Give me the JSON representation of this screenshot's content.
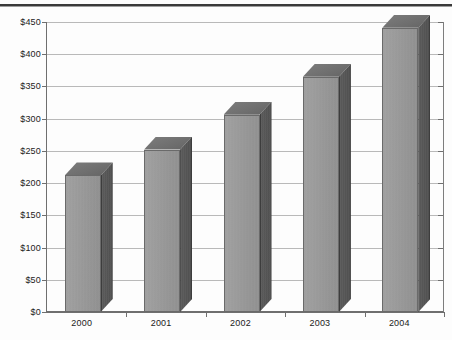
{
  "chart_data": {
    "type": "bar",
    "title": "",
    "subtitle": "",
    "xlabel": "",
    "ylabel": "",
    "categories": [
      "2000",
      "2001",
      "2002",
      "2003",
      "2004"
    ],
    "values": [
      212,
      252,
      306,
      365,
      441
    ],
    "ylim": [
      0,
      450
    ],
    "ytick_values": [
      0,
      50,
      100,
      150,
      200,
      250,
      300,
      350,
      400,
      450
    ],
    "ytick_labels": [
      "$0",
      "$50",
      "$100",
      "$150",
      "$200",
      "$250",
      "$300",
      "$350",
      "$400",
      "$450"
    ],
    "value_prefix": "$",
    "grid": true,
    "grid_axis": "y",
    "legend": false,
    "legend_position": "none",
    "style": "3d-column",
    "series": [
      {
        "name": "",
        "values": [
          212,
          252,
          306,
          365,
          441
        ]
      }
    ],
    "colors": {
      "bar_front": "#9b9b9b",
      "bar_side": "#545454",
      "bar_top": "#6e6e6e",
      "bar_outline": "#6a6a6a",
      "gridline": "#b9b9b9",
      "axis": "#6f6f6f",
      "text": "#1b1b1b",
      "background": "#ffffff",
      "top_rule": "#3a3a3a"
    }
  }
}
